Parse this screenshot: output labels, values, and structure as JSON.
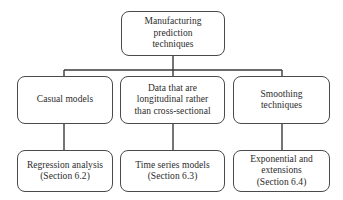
{
  "diagram": {
    "title": "Manufacturing prediction techniques",
    "type": "hierarchy-tree",
    "background_color": "#ffffff",
    "node_border_color": "#4a4a4a",
    "connector_color": "#3a3a3a",
    "text_color": "#2b2b2b",
    "nodes": {
      "root": {
        "label": "Manufacturing\nprediction\ntechniques"
      },
      "branch_casual": {
        "label": "Casual models"
      },
      "branch_longitudinal": {
        "label": "Data that are\nlongitudinal rather\nthan cross-sectional"
      },
      "branch_smoothing": {
        "label": "Smoothing\ntechniques"
      },
      "leaf_regression": {
        "label": "Regression analysis\n(Section 6.2)"
      },
      "leaf_timeseries": {
        "label": "Time series models\n(Section 6.3)"
      },
      "leaf_exponential": {
        "label": "Exponential and\nextensions\n(Section 6.4)"
      }
    }
  }
}
